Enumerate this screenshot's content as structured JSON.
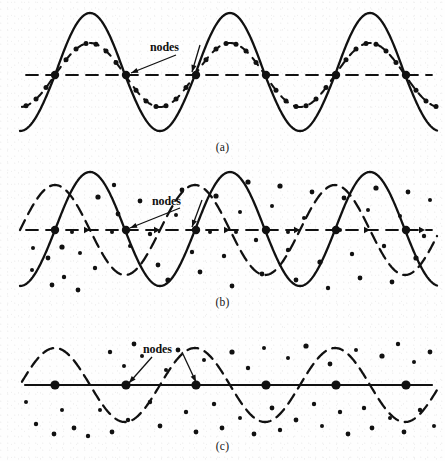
{
  "figure": {
    "width": 445,
    "height": 461,
    "ink_color": "#111111",
    "paper_color": "#fefefe",
    "node_label_text": "nodes"
  },
  "panels": [
    {
      "id": "a",
      "caption": "(a)",
      "caption_x": 225,
      "caption_y": 141,
      "axis_y": 75,
      "axis_x_start": 26,
      "axis_x_end": 432,
      "axis_style": "dashed",
      "label": {
        "text": "nodes",
        "x": 150,
        "y": 40,
        "arrows": [
          {
            "x1": 176,
            "y1": 55,
            "x2": 131,
            "y2": 73
          },
          {
            "x1": 200,
            "y1": 45,
            "x2": 192,
            "y2": 72
          }
        ]
      },
      "nodes": [
        55,
        126,
        196,
        266,
        336,
        406
      ],
      "node_radius": 4.2,
      "curves": [
        {
          "name": "resultant-wave",
          "style": "solid",
          "amplitude": 62,
          "trough_amplitude": 56,
          "wavelength": 140,
          "phase_x": 55,
          "x_start": 20,
          "x_end": 437,
          "stroke_width": 2.3,
          "dotted_markers": false
        },
        {
          "name": "component-wave",
          "style": "dash-dot",
          "amplitude": 32,
          "trough_amplitude": 32,
          "wavelength": 140,
          "phase_x": 55,
          "x_start": 22,
          "x_end": 437,
          "stroke_width": 2.1,
          "dotted_markers": true
        }
      ],
      "scatter_dots": []
    },
    {
      "id": "b",
      "caption": "(b)",
      "caption_x": 225,
      "caption_y": 296,
      "axis_y": 230,
      "axis_x_start": 26,
      "axis_x_end": 432,
      "axis_style": "dashed-arrow",
      "label": {
        "text": "nodes",
        "x": 152,
        "y": 194,
        "arrows": [
          {
            "x1": 180,
            "y1": 208,
            "x2": 130,
            "y2": 228
          },
          {
            "x1": 202,
            "y1": 200,
            "x2": 192,
            "y2": 227
          }
        ]
      },
      "nodes": [
        55,
        126,
        196,
        266,
        336,
        406
      ],
      "node_radius": 4.2,
      "curves": [
        {
          "name": "solid-wave",
          "style": "solid",
          "amplitude": 58,
          "trough_amplitude": 56,
          "wavelength": 140,
          "phase_x": 55,
          "x_start": 20,
          "x_end": 437,
          "stroke_width": 2.3,
          "dotted_markers": false
        },
        {
          "name": "dashed-wave",
          "style": "dashed",
          "amplitude": 45,
          "trough_amplitude": 45,
          "wavelength": 140,
          "phase_x": 20,
          "x_start": 20,
          "x_end": 437,
          "stroke_width": 2.3,
          "dotted_markers": false
        }
      ],
      "scatter_dots": [
        [
          33,
          248,
          2.0
        ],
        [
          32,
          270,
          2.0
        ],
        [
          48,
          258,
          2.4
        ],
        [
          52,
          285,
          2.4
        ],
        [
          62,
          247,
          2.6
        ],
        [
          64,
          277,
          2.2
        ],
        [
          78,
          290,
          2.4
        ],
        [
          80,
          253,
          2.0
        ],
        [
          95,
          268,
          2.2
        ],
        [
          98,
          197,
          2.6
        ],
        [
          114,
          185,
          2.2
        ],
        [
          118,
          214,
          2.4
        ],
        [
          130,
          246,
          2.0
        ],
        [
          140,
          201,
          2.4
        ],
        [
          150,
          234,
          2.2
        ],
        [
          158,
          265,
          2.4
        ],
        [
          168,
          280,
          2.6
        ],
        [
          176,
          215,
          2.0
        ],
        [
          182,
          190,
          2.4
        ],
        [
          192,
          252,
          2.2
        ],
        [
          200,
          272,
          2.4
        ],
        [
          210,
          232,
          2.0
        ],
        [
          216,
          196,
          2.6
        ],
        [
          224,
          256,
          2.2
        ],
        [
          232,
          286,
          2.4
        ],
        [
          240,
          212,
          2.0
        ],
        [
          248,
          182,
          2.6
        ],
        [
          256,
          240,
          2.2
        ],
        [
          262,
          274,
          2.4
        ],
        [
          272,
          206,
          2.0
        ],
        [
          280,
          186,
          2.6
        ],
        [
          288,
          250,
          2.2
        ],
        [
          296,
          280,
          2.4
        ],
        [
          304,
          218,
          2.0
        ],
        [
          312,
          192,
          2.4
        ],
        [
          320,
          262,
          2.6
        ],
        [
          328,
          288,
          2.2
        ],
        [
          336,
          228,
          2.0
        ],
        [
          344,
          198,
          2.4
        ],
        [
          352,
          254,
          2.2
        ],
        [
          360,
          278,
          2.4
        ],
        [
          368,
          210,
          2.0
        ],
        [
          376,
          188,
          2.6
        ],
        [
          384,
          246,
          2.2
        ],
        [
          392,
          282,
          2.4
        ],
        [
          400,
          216,
          2.0
        ],
        [
          408,
          192,
          2.4
        ],
        [
          416,
          258,
          2.6
        ],
        [
          424,
          236,
          2.2
        ],
        [
          430,
          200,
          2.0
        ],
        [
          236,
          232,
          2.0
        ],
        [
          288,
          232,
          2.0
        ],
        [
          340,
          230,
          2.0
        ],
        [
          196,
          232,
          2.0
        ],
        [
          112,
          232,
          2.0
        ],
        [
          72,
          232,
          2.0
        ]
      ]
    },
    {
      "id": "c",
      "caption": "(c)",
      "caption_x": 225,
      "caption_y": 440,
      "axis_y": 385,
      "axis_x_start": 25,
      "axis_x_end": 432,
      "axis_style": "solid",
      "label": {
        "text": "nodes",
        "x": 143,
        "y": 342,
        "arrows": [
          {
            "x1": 152,
            "y1": 357,
            "x2": 129,
            "y2": 383
          },
          {
            "x1": 182,
            "y1": 352,
            "x2": 196,
            "y2": 382
          }
        ]
      },
      "nodes": [
        55,
        126,
        196,
        266,
        336,
        406
      ],
      "node_radius": 4.6,
      "curves": [
        {
          "name": "dashed-wave",
          "style": "dashed",
          "amplitude": 37,
          "trough_amplitude": 37,
          "wavelength": 140,
          "phase_x": 20,
          "x_start": 22,
          "x_end": 437,
          "stroke_width": 2.3,
          "dotted_markers": false
        }
      ],
      "scatter_dots": [
        [
          26,
          402,
          2.0
        ],
        [
          36,
          424,
          2.2
        ],
        [
          54,
          434,
          2.4
        ],
        [
          62,
          410,
          2.0
        ],
        [
          74,
          428,
          2.4
        ],
        [
          88,
          436,
          2.2
        ],
        [
          100,
          410,
          2.0
        ],
        [
          110,
          352,
          2.2
        ],
        [
          112,
          432,
          2.4
        ],
        [
          124,
          366,
          2.0
        ],
        [
          128,
          420,
          2.2
        ],
        [
          134,
          344,
          2.4
        ],
        [
          142,
          356,
          2.0
        ],
        [
          150,
          402,
          2.2
        ],
        [
          160,
          426,
          2.4
        ],
        [
          166,
          370,
          2.0
        ],
        [
          178,
          350,
          2.4
        ],
        [
          186,
          412,
          2.2
        ],
        [
          196,
          432,
          2.4
        ],
        [
          204,
          360,
          2.0
        ],
        [
          214,
          404,
          2.2
        ],
        [
          222,
          428,
          2.4
        ],
        [
          232,
          352,
          2.6
        ],
        [
          240,
          418,
          2.0
        ],
        [
          248,
          368,
          2.2
        ],
        [
          254,
          434,
          2.4
        ],
        [
          264,
          348,
          2.0
        ],
        [
          272,
          408,
          2.4
        ],
        [
          280,
          430,
          2.2
        ],
        [
          288,
          358,
          2.0
        ],
        [
          296,
          420,
          2.4
        ],
        [
          306,
          346,
          2.6
        ],
        [
          314,
          404,
          2.2
        ],
        [
          322,
          426,
          2.0
        ],
        [
          330,
          364,
          2.4
        ],
        [
          340,
          412,
          2.2
        ],
        [
          348,
          434,
          2.4
        ],
        [
          356,
          350,
          2.0
        ],
        [
          364,
          408,
          2.2
        ],
        [
          372,
          428,
          2.4
        ],
        [
          382,
          356,
          2.6
        ],
        [
          390,
          418,
          2.0
        ],
        [
          398,
          344,
          2.2
        ],
        [
          404,
          432,
          2.4
        ],
        [
          414,
          362,
          2.0
        ],
        [
          420,
          410,
          2.2
        ],
        [
          430,
          352,
          2.4
        ],
        [
          434,
          426,
          2.0
        ]
      ]
    }
  ]
}
